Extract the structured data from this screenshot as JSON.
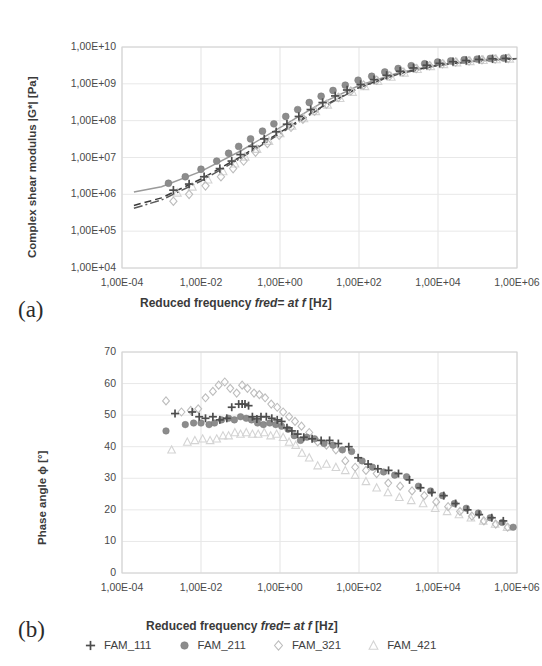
{
  "figure": {
    "panel_a_tag": "(a)",
    "panel_b_tag": "(b)"
  },
  "legend": {
    "position": "bottom",
    "items": [
      {
        "label": "FAM_111",
        "marker": "plus-marker-icon",
        "color": "#4d4d4d"
      },
      {
        "label": "FAM_211",
        "marker": "filled-circle-marker-icon",
        "color": "#8c8c8c"
      },
      {
        "label": "FAM_321",
        "marker": "open-diamond-marker-icon",
        "color": "#bdbdbd"
      },
      {
        "label": "FAM_421",
        "marker": "open-triangle-marker-icon",
        "color": "#d4d4d4"
      }
    ]
  },
  "chart_data": [
    {
      "type": "scatter",
      "panel": "a",
      "title": "",
      "xlabel_parts": {
        "pre": "Reduced frequency ",
        "italic": "fred= at f",
        "post": " [Hz]"
      },
      "xlabel": "Reduced frequency fred= at f [Hz]",
      "ylabel": "Complex shear modulus |G*| [Pa]",
      "xscale": "log",
      "yscale": "log",
      "xlim": [
        0.0001,
        1000000.0
      ],
      "ylim": [
        10000.0,
        10000000000.0
      ],
      "xticks": [
        0.0001,
        0.01,
        1,
        100,
        10000,
        1000000
      ],
      "xticklabels": [
        "1,00E-04",
        "1,00E-02",
        "1,00E+00",
        "1,00E+02",
        "1,00E+04",
        "1,00E+06"
      ],
      "yticks": [
        10000.0,
        100000.0,
        1000000.0,
        10000000.0,
        100000000.0,
        1000000000.0,
        10000000000.0
      ],
      "yticklabels": [
        "1,00E+04",
        "1,00E+05",
        "1,00E+06",
        "1,00E+07",
        "1,00E+08",
        "1,00E+09",
        "1,00E+10"
      ],
      "grid": true,
      "legend_position": "below-panel-b",
      "series": [
        {
          "name": "FAM_111",
          "marker": "plus",
          "color": "#4d4d4d",
          "x": [
            0.002,
            0.005,
            0.012,
            0.03,
            0.06,
            0.1,
            0.2,
            0.4,
            0.8,
            1.5,
            3,
            6,
            12,
            25,
            50,
            110,
            240,
            500,
            1100,
            2400,
            5200,
            11000,
            24000,
            52000,
            110000,
            240000,
            520000
          ],
          "y": [
            1300000.0,
            1900000.0,
            3000000.0,
            5000000.0,
            8000000.0,
            12000000.0,
            20000000.0,
            32000000.0,
            50000000.0,
            80000000.0,
            130000000.0,
            200000000.0,
            310000000.0,
            470000000.0,
            680000000.0,
            960000000.0,
            1300000000.0,
            1700000000.0,
            2200000000.0,
            2700000000.0,
            3200000000.0,
            3600000000.0,
            4000000000.0,
            4300000000.0,
            4600000000.0,
            4800000000.0,
            4900000000.0
          ]
        },
        {
          "name": "FAM_211",
          "marker": "circle",
          "color": "#8c8c8c",
          "x": [
            0.0015,
            0.004,
            0.01,
            0.025,
            0.05,
            0.09,
            0.18,
            0.36,
            0.7,
            1.4,
            2.8,
            5.5,
            11,
            22,
            45,
            95,
            210,
            450,
            980,
            2100,
            4600,
            9800,
            21000,
            46000,
            98000,
            210000,
            460000
          ],
          "y": [
            2000000.0,
            3000000.0,
            4800000.0,
            8000000.0,
            13000000.0,
            20000000.0,
            32000000.0,
            52000000.0,
            82000000.0,
            130000000.0,
            200000000.0,
            310000000.0,
            460000000.0,
            660000000.0,
            920000000.0,
            1250000000.0,
            1600000000.0,
            2100000000.0,
            2600000000.0,
            3100000000.0,
            3500000000.0,
            3900000000.0,
            4200000000.0,
            4500000000.0,
            4700000000.0,
            4900000000.0,
            5000000000.0
          ]
        },
        {
          "name": "FAM_321",
          "marker": "diamond",
          "color": "#bdbdbd",
          "x": [
            0.002,
            0.005,
            0.013,
            0.032,
            0.065,
            0.12,
            0.24,
            0.48,
            0.95,
            1.9,
            3.8,
            7.5,
            15,
            30,
            62,
            130,
            280,
            600,
            1300,
            2800,
            6100,
            13000,
            28000,
            61000,
            130000,
            280000,
            600000
          ],
          "y": [
            650000.0,
            1000000.0,
            1700000.0,
            3000000.0,
            5000000.0,
            8000000.0,
            14000000.0,
            24000000.0,
            40000000.0,
            66000000.0,
            110000000.0,
            180000000.0,
            280000000.0,
            430000000.0,
            640000000.0,
            920000000.0,
            1250000000.0,
            1650000000.0,
            2100000000.0,
            2600000000.0,
            3100000000.0,
            3500000000.0,
            3900000000.0,
            4200000000.0,
            4500000000.0,
            4700000000.0,
            4900000000.0
          ]
        },
        {
          "name": "FAM_421",
          "marker": "triangle",
          "color": "#d4d4d4",
          "x": [
            0.0025,
            0.006,
            0.015,
            0.036,
            0.072,
            0.13,
            0.26,
            0.52,
            1.0,
            2.0,
            4.0,
            8.0,
            16,
            33,
            68,
            140,
            300,
            650,
            1400,
            3000,
            6500,
            14000,
            30000,
            65000,
            140000,
            300000,
            650000
          ],
          "y": [
            1100000.0,
            1600000.0,
            2500000.0,
            4200000.0,
            6800000.0,
            10500000.0,
            17000000.0,
            28000000.0,
            45000000.0,
            72000000.0,
            115000000.0,
            180000000.0,
            270000000.0,
            410000000.0,
            600000000.0,
            860000000.0,
            1180000000.0,
            1550000000.0,
            2000000000.0,
            2500000000.0,
            3000000000.0,
            3400000000.0,
            3800000000.0,
            4100000000.0,
            4400000000.0,
            4600000000.0,
            4800000000.0
          ]
        }
      ],
      "fit_lines": [
        {
          "name": "fit-solid",
          "style": "solid",
          "color": "#9a9a9a",
          "x": [
            0.0002,
            0.001,
            0.01,
            0.1,
            1,
            10,
            100,
            1000,
            10000,
            100000,
            1000000
          ],
          "y": [
            1150000.0,
            1600000.0,
            4200000.0,
            15000000.0,
            65000000.0,
            280000000.0,
            900000000.0,
            2000000000.0,
            3300000000.0,
            4300000000.0,
            4900000000.0
          ]
        },
        {
          "name": "fit-dashed",
          "style": "dashed",
          "color": "#3a3a3a",
          "x": [
            0.0002,
            0.001,
            0.01,
            0.1,
            1,
            10,
            100,
            1000,
            10000,
            100000,
            1000000
          ],
          "y": [
            500000.0,
            800000.0,
            2600000.0,
            10500000.0,
            48000000.0,
            220000000.0,
            800000000.0,
            1900000000.0,
            3200000000.0,
            4200000000.0,
            4850000000.0
          ]
        },
        {
          "name": "fit-dashdot",
          "style": "dashdot",
          "color": "#5a5a5a",
          "x": [
            0.0002,
            0.001,
            0.01,
            0.1,
            1,
            10,
            100,
            1000,
            10000,
            100000,
            1000000
          ],
          "y": [
            420000.0,
            700000.0,
            2300000.0,
            9500000.0,
            44000000.0,
            210000000.0,
            780000000.0,
            1850000000.0,
            3150000000.0,
            4150000000.0,
            4800000000.0
          ]
        }
      ]
    },
    {
      "type": "scatter",
      "panel": "b",
      "title": "",
      "xlabel_parts": {
        "pre": "Reduced frequency ",
        "italic": "fred= at f",
        "post": "  [Hz]"
      },
      "xlabel": "Reduced frequency fred= at f  [Hz]",
      "ylabel": "Phase angle ϕ [°]",
      "xscale": "log",
      "yscale": "linear",
      "xlim": [
        0.0001,
        1000000.0
      ],
      "ylim": [
        0,
        70
      ],
      "xticks": [
        0.0001,
        0.01,
        1,
        100,
        10000,
        1000000
      ],
      "xticklabels": [
        "1,00E-04",
        "1,00E-02",
        "1,00E+00",
        "1,00E+02",
        "1,00E+04",
        "1,00E+06"
      ],
      "yticks": [
        0,
        10,
        20,
        30,
        40,
        50,
        60,
        70
      ],
      "yticklabels": [
        "0",
        "10",
        "20",
        "30",
        "40",
        "50",
        "60",
        "70"
      ],
      "grid": true,
      "series": [
        {
          "name": "FAM_111",
          "marker": "plus",
          "color": "#4d4d4d",
          "x": [
            0.0022,
            0.006,
            0.009,
            0.013,
            0.02,
            0.03,
            0.045,
            0.06,
            0.09,
            0.11,
            0.13,
            0.16,
            0.2,
            0.26,
            0.33,
            0.45,
            0.62,
            0.85,
            1.1,
            1.5,
            2.0,
            2.8,
            4.0,
            6.5,
            11,
            18,
            30,
            55,
            95,
            170,
            300,
            560,
            1000,
            1900,
            3600,
            7000,
            14000,
            28000,
            56000,
            110000,
            230000,
            450000
          ],
          "y": [
            50.5,
            51.0,
            49.5,
            49.0,
            49.5,
            48.5,
            49.0,
            52.5,
            53.5,
            53.5,
            53.5,
            53.0,
            49.5,
            48.8,
            49.5,
            49.5,
            49.0,
            48.5,
            48.0,
            46.0,
            45.0,
            44.0,
            43.0,
            42.5,
            42.0,
            42.0,
            41.0,
            40.0,
            36.5,
            34.5,
            33.0,
            32.5,
            31.5,
            29.5,
            27.0,
            25.5,
            24.5,
            22.0,
            20.0,
            18.5,
            17.5,
            16.5
          ]
        },
        {
          "name": "FAM_211",
          "marker": "circle",
          "color": "#8c8c8c",
          "x": [
            0.0013,
            0.004,
            0.0065,
            0.01,
            0.016,
            0.022,
            0.033,
            0.05,
            0.07,
            0.1,
            0.14,
            0.19,
            0.27,
            0.38,
            0.55,
            0.78,
            1.1,
            1.6,
            2.3,
            3.3,
            4.8,
            7.5,
            13,
            22,
            38,
            65,
            120,
            220,
            420,
            800,
            1600,
            3200,
            6500,
            13000,
            26000,
            52000,
            105000,
            210000,
            420000,
            800000
          ],
          "y": [
            45.0,
            47.0,
            47.5,
            47.5,
            47.0,
            47.5,
            48.5,
            49.0,
            48.5,
            49.5,
            49.0,
            48.5,
            47.5,
            47.0,
            47.5,
            47.0,
            46.5,
            45.5,
            43.5,
            42.0,
            43.0,
            42.5,
            41.0,
            40.5,
            39.0,
            38.5,
            35.5,
            33.5,
            32.0,
            31.0,
            30.5,
            27.5,
            26.0,
            24.5,
            22.0,
            20.5,
            19.0,
            17.5,
            16.0,
            14.5
          ]
        },
        {
          "name": "FAM_321",
          "marker": "diamond",
          "color": "#bdbdbd",
          "x": [
            0.0013,
            0.0032,
            0.0055,
            0.0085,
            0.013,
            0.02,
            0.028,
            0.04,
            0.055,
            0.08,
            0.11,
            0.15,
            0.22,
            0.3,
            0.42,
            0.6,
            0.85,
            1.2,
            1.7,
            2.4,
            3.5,
            5.5,
            9,
            15,
            26,
            45,
            80,
            150,
            280,
            550,
            1100,
            2200,
            4500,
            9000,
            18000,
            36000,
            72000,
            145000,
            290000,
            580000
          ],
          "y": [
            54.5,
            51.0,
            51.5,
            52.0,
            55.5,
            57.5,
            59.5,
            60.5,
            58.5,
            57.0,
            59.5,
            58.5,
            57.0,
            56.5,
            55.5,
            53.5,
            52.5,
            51.0,
            49.5,
            48.0,
            46.5,
            44.5,
            41.5,
            40.5,
            39.0,
            35.5,
            33.5,
            32.5,
            31.5,
            28.5,
            27.5,
            26.0,
            24.5,
            22.5,
            21.0,
            19.5,
            18.0,
            16.5,
            15.5,
            14.5
          ]
        },
        {
          "name": "FAM_421",
          "marker": "triangle",
          "color": "#d4d4d4",
          "x": [
            0.0018,
            0.0045,
            0.007,
            0.011,
            0.017,
            0.025,
            0.036,
            0.05,
            0.072,
            0.1,
            0.14,
            0.2,
            0.28,
            0.4,
            0.58,
            0.82,
            1.2,
            1.7,
            2.5,
            3.6,
            5.5,
            9,
            15,
            26,
            45,
            80,
            150,
            280,
            540,
            1050,
            2100,
            4200,
            8500,
            17000,
            34000,
            68000,
            140000,
            280000,
            560000
          ],
          "y": [
            39.0,
            41.5,
            42.0,
            42.5,
            42.0,
            42.5,
            43.5,
            43.5,
            44.5,
            44.0,
            44.5,
            44.0,
            44.0,
            44.5,
            43.5,
            44.0,
            43.0,
            41.5,
            40.5,
            38.0,
            36.5,
            34.0,
            34.5,
            33.5,
            32.5,
            31.0,
            29.0,
            27.0,
            25.5,
            24.0,
            23.0,
            22.0,
            20.5,
            19.5,
            18.5,
            17.5,
            16.5,
            15.5,
            14.5
          ]
        }
      ]
    }
  ]
}
